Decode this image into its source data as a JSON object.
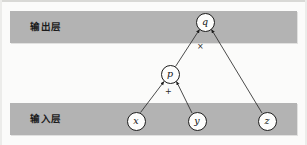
{
  "figure": {
    "band_color": "#b3b3b3",
    "node_fill": "#fdfdfc",
    "stroke_color": "#1d1d1d"
  },
  "layers": {
    "output": {
      "label": "输出层"
    },
    "input": {
      "label": "输入层"
    }
  },
  "nodes": [
    {
      "id": "q",
      "label": "q",
      "x": 205,
      "y": 22,
      "layer": "output"
    },
    {
      "id": "p",
      "label": "p",
      "x": 170,
      "y": 74,
      "layer": "hidden"
    },
    {
      "id": "x",
      "label": "x",
      "x": 136,
      "y": 121,
      "layer": "input"
    },
    {
      "id": "y",
      "label": "y",
      "x": 197,
      "y": 121,
      "layer": "input"
    },
    {
      "id": "z",
      "label": "z",
      "x": 267,
      "y": 121,
      "layer": "input"
    }
  ],
  "edges": [
    {
      "from": "x",
      "to": "p"
    },
    {
      "from": "y",
      "to": "p"
    },
    {
      "from": "p",
      "to": "q"
    },
    {
      "from": "z",
      "to": "q"
    }
  ],
  "operators": [
    {
      "id": "mul",
      "node": "q",
      "label": "×",
      "x": 197,
      "y": 43
    },
    {
      "id": "add",
      "node": "p",
      "label": "+",
      "x": 165,
      "y": 88
    }
  ]
}
